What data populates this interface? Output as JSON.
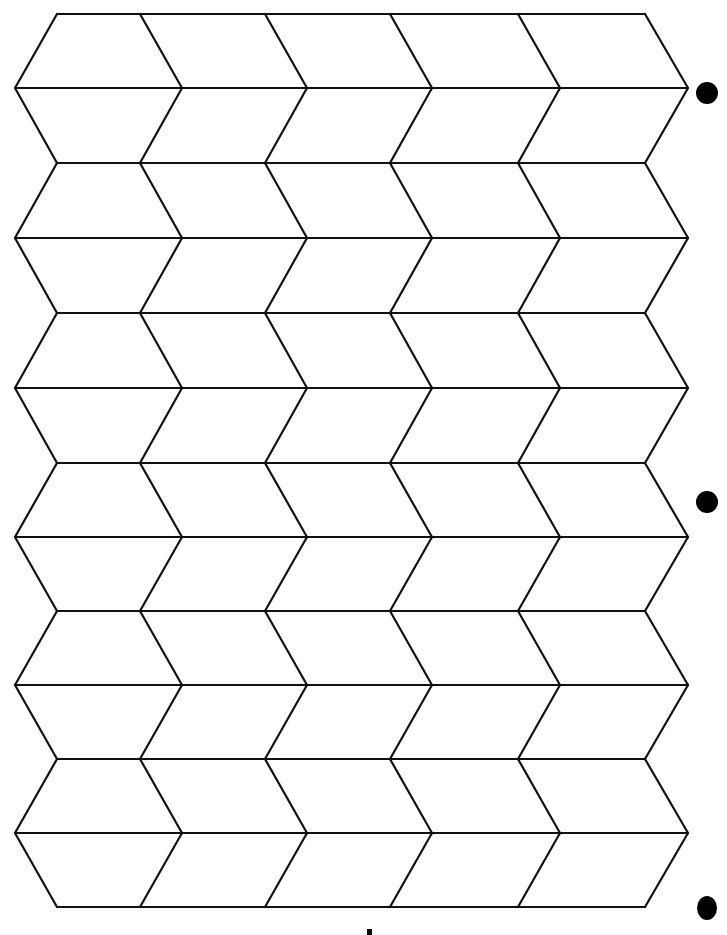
{
  "page": {
    "background": "#ffffff",
    "line_color": "#111111"
  },
  "grid": {
    "row_lines_y": [
      14,
      88,
      163,
      238,
      313,
      388,
      463,
      537,
      611,
      685,
      759,
      833,
      907
    ],
    "even_line_x": [
      57,
      140,
      265,
      390,
      518,
      645
    ],
    "odd_line_x": [
      15,
      182,
      307,
      432,
      560,
      688
    ],
    "even_line_span": [
      57,
      645
    ],
    "odd_line_span": [
      15,
      688
    ]
  },
  "binder_holes": [
    {
      "x": 707,
      "y": 93,
      "r": 11
    },
    {
      "x": 707,
      "y": 502,
      "r": 11
    },
    {
      "x": 707,
      "y": 908,
      "rx": 10,
      "ry": 12
    }
  ],
  "bottom_mark": {
    "x": 367,
    "y": 929,
    "w": 5,
    "h": 6
  }
}
